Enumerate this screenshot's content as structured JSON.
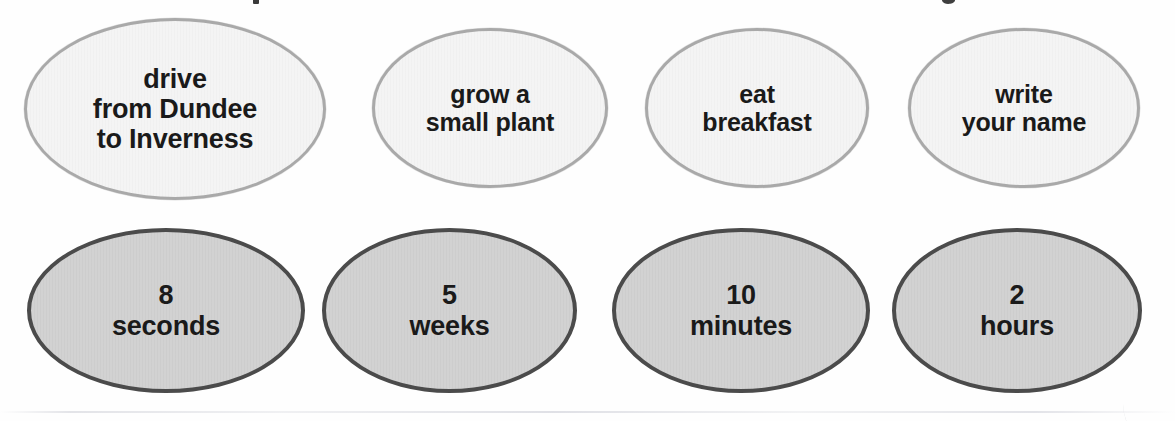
{
  "page": {
    "kind": "matching-worksheet",
    "background_color": "#ffffff",
    "scan_note": "title line clipped off top edge"
  },
  "activity_row": {
    "fill_color": "#f4f4f4",
    "border_color": "#a9a9a9",
    "text_color": "#1a1a1a",
    "cards": [
      {
        "id": "drive",
        "text": "drive\nfrom Dundee\nto Inverness"
      },
      {
        "id": "grow",
        "text": "grow a\nsmall plant"
      },
      {
        "id": "breakfast",
        "text": "eat\nbreakfast"
      },
      {
        "id": "write",
        "text": "write\nyour name"
      }
    ]
  },
  "duration_row": {
    "fill_color": "#d2d2d2",
    "border_color": "#4b4b4b",
    "text_color": "#1a1a1a",
    "cards": [
      {
        "id": "seconds",
        "value": "8",
        "unit": "seconds",
        "text": "8\nseconds"
      },
      {
        "id": "weeks",
        "value": "5",
        "unit": "weeks",
        "text": "5\nweeks"
      },
      {
        "id": "minutes",
        "value": "10",
        "unit": "minutes",
        "text": "10\nminutes"
      },
      {
        "id": "hours",
        "value": "2",
        "unit": "hours",
        "text": "2\nhours"
      }
    ]
  }
}
